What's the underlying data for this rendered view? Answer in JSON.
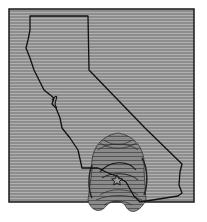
{
  "map": {
    "region": "California",
    "style": "grayscale contour",
    "colors": {
      "background": "#ffffff",
      "field": "#8a8a8a",
      "field_lines": "#b4b4b4",
      "border": "#1a1a1a",
      "outline": "#111111",
      "contour_fill": "#7a7a7a",
      "contour_lines": "#2a2a2a"
    },
    "marker": {
      "type": "star",
      "label": ""
    }
  }
}
